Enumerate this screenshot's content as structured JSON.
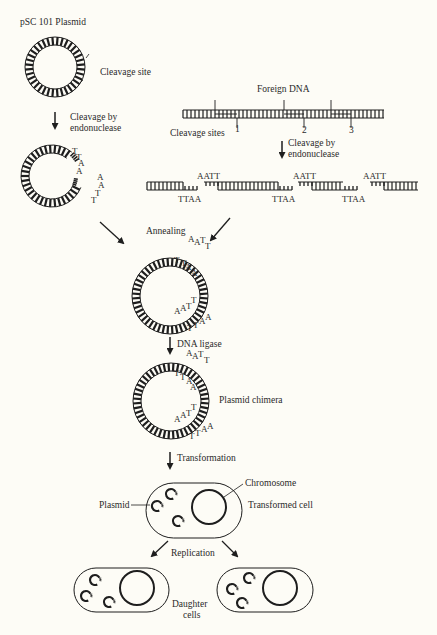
{
  "colors": {
    "background": "#fdfcf6",
    "ink": "#1e1e1e",
    "text": "#2a2a2a"
  },
  "title": "pSC 101 Plasmid",
  "labels": {
    "cleavage_site": "Cleavage site",
    "cleavage_by_1": "Cleavage by",
    "cleavage_by_2": "endonuclease",
    "foreign_dna": "Foreign DNA",
    "cleavage_sites": "Cleavage sites",
    "site_numbers": [
      "1",
      "2",
      "3"
    ],
    "cleavage_by_b1": "Cleavage by",
    "cleavage_by_b2": "endonuclease",
    "annealing": "Annealing",
    "dna_ligase": "DNA ligase",
    "plasmid_chimera": "Plasmid chimera",
    "transformation": "Transformation",
    "chromosome": "Chromosome",
    "plasmid": "Plasmid",
    "transformed_cell": "Transformed cell",
    "replication": "Replication",
    "daughter_1": "Daughter",
    "daughter_2": "cells"
  },
  "sticky_ends": {
    "top": "AATT",
    "bottom": "TTAA",
    "cleaved_plasmid_left": [
      "T",
      "T",
      "A",
      "A"
    ],
    "cleaved_plasmid_right": [
      "A",
      "A",
      "T",
      "T"
    ]
  },
  "annealed_bases": {
    "outer_top": [
      "A",
      "A",
      "T",
      "T"
    ],
    "inner_top": [
      "T",
      "T",
      "A",
      "A"
    ],
    "inner_bottom": [
      "A",
      "A",
      "T",
      "T"
    ],
    "outer_bottom": [
      "T",
      "T",
      "A",
      "A"
    ]
  }
}
